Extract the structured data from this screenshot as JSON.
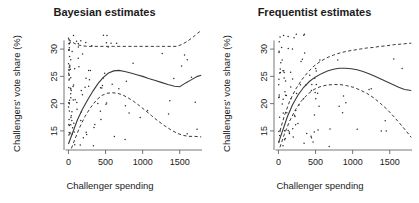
{
  "figure": {
    "running_head": "",
    "panels": [
      {
        "key": "bayesian",
        "title": "Bayesian estimates",
        "xlabel": "Challenger spending",
        "ylabel": "Challengers' vote share (%)"
      },
      {
        "key": "frequentist",
        "title": "Frequentist estimates",
        "xlabel": "Challenger spending",
        "ylabel": "Challengers' vote share (%)"
      }
    ],
    "xticks": [
      "0",
      "500",
      "1000",
      "1500"
    ],
    "yticks": [
      "15",
      "20",
      "25",
      "30"
    ]
  },
  "chart_data": [
    {
      "type": "line",
      "title": "Bayesian estimates",
      "xlabel": "Challenger spending",
      "ylabel": "Challengers' vote share (%)",
      "xlim": [
        -60,
        1800
      ],
      "ylim": [
        11.5,
        33.5
      ],
      "xticks": [
        0,
        500,
        1000,
        1500
      ],
      "yticks": [
        15,
        20,
        25,
        30
      ],
      "grid": false,
      "legend": "none",
      "series": [
        {
          "name": "posterior mean",
          "style": "solid",
          "x": [
            0,
            60,
            120,
            190,
            260,
            330,
            400,
            470,
            540,
            610,
            680,
            760,
            840,
            920,
            1000,
            1080,
            1160,
            1250,
            1340,
            1430,
            1500,
            1580,
            1660,
            1740,
            1790
          ],
          "y": [
            12.6,
            14.8,
            17.0,
            19.0,
            20.7,
            22.3,
            23.7,
            24.8,
            25.6,
            26.0,
            26.1,
            25.9,
            25.6,
            25.3,
            25.0,
            24.6,
            24.3,
            23.9,
            23.5,
            23.2,
            23.1,
            23.8,
            24.4,
            25.0,
            25.2
          ]
        },
        {
          "name": "upper 95% credible bound",
          "style": "dashed",
          "x": [
            0,
            60,
            120,
            190,
            260,
            330,
            400,
            470,
            540,
            610,
            700,
            800,
            900,
            1000,
            1100,
            1200,
            1300,
            1400,
            1460,
            1520,
            1600,
            1680,
            1740,
            1790
          ],
          "y": [
            31.8,
            31.2,
            30.8,
            30.6,
            30.5,
            30.5,
            30.5,
            30.5,
            30.5,
            30.5,
            30.5,
            30.5,
            30.5,
            30.5,
            30.5,
            30.5,
            30.5,
            30.5,
            30.5,
            30.8,
            31.4,
            32.2,
            32.9,
            33.4
          ]
        },
        {
          "name": "lower 95% credible bound",
          "style": "dashed",
          "x": [
            40,
            90,
            150,
            220,
            300,
            380,
            450,
            520,
            590,
            660,
            730,
            800,
            880,
            960,
            1040,
            1120,
            1200,
            1290,
            1380,
            1460,
            1540,
            1620,
            1700,
            1790
          ],
          "y": [
            11.8,
            13.6,
            15.6,
            17.6,
            19.3,
            20.7,
            21.5,
            21.9,
            22.0,
            21.9,
            21.6,
            21.1,
            20.4,
            19.6,
            18.7,
            17.8,
            16.9,
            16.0,
            15.2,
            14.6,
            14.2,
            14.0,
            14.0,
            13.9
          ]
        }
      ],
      "scatter": {
        "name": "observations",
        "n": 150,
        "note": "dense cluster at low challenger spending, spread across 12-33% vote share"
      }
    },
    {
      "type": "line",
      "title": "Frequentist estimates",
      "xlabel": "Challenger spending",
      "ylabel": "Challengers' vote share (%)",
      "xlim": [
        -60,
        1800
      ],
      "ylim": [
        11.5,
        33.5
      ],
      "xticks": [
        0,
        500,
        1000,
        1500
      ],
      "yticks": [
        15,
        20,
        25,
        30
      ],
      "grid": false,
      "legend": "none",
      "series": [
        {
          "name": "fitted smooth",
          "style": "solid",
          "x": [
            0,
            60,
            120,
            190,
            260,
            340,
            420,
            500,
            580,
            660,
            740,
            820,
            900,
            980,
            1060,
            1140,
            1220,
            1300,
            1380,
            1460,
            1540,
            1620,
            1700,
            1790
          ],
          "y": [
            12.8,
            15.2,
            17.6,
            19.8,
            21.5,
            23.0,
            24.1,
            24.9,
            25.5,
            26.0,
            26.3,
            26.5,
            26.5,
            26.4,
            26.2,
            25.9,
            25.5,
            25.0,
            24.5,
            24.0,
            23.5,
            23.0,
            22.6,
            22.4
          ]
        },
        {
          "name": "upper 95% confidence bound",
          "style": "dashed",
          "x": [
            20,
            80,
            150,
            230,
            310,
            400,
            480,
            560,
            650,
            740,
            830,
            920,
            1010,
            1100,
            1190,
            1280,
            1370,
            1460,
            1550,
            1640,
            1720,
            1790
          ],
          "y": [
            15.0,
            17.8,
            20.4,
            22.6,
            24.3,
            25.8,
            26.9,
            27.7,
            28.4,
            28.9,
            29.3,
            29.6,
            29.8,
            30.0,
            30.2,
            30.3,
            30.5,
            30.6,
            30.8,
            30.9,
            31.0,
            31.1
          ]
        },
        {
          "name": "lower 95% confidence bound",
          "style": "dashed",
          "x": [
            20,
            80,
            150,
            230,
            310,
            400,
            480,
            560,
            650,
            740,
            830,
            920,
            1010,
            1100,
            1190,
            1280,
            1370,
            1460,
            1550,
            1640,
            1720,
            1790
          ],
          "y": [
            12.0,
            14.4,
            16.8,
            18.9,
            20.5,
            21.8,
            22.6,
            23.1,
            23.4,
            23.5,
            23.5,
            23.3,
            23.0,
            22.5,
            21.9,
            21.1,
            20.1,
            19.0,
            17.7,
            16.3,
            15.0,
            13.8
          ]
        }
      ],
      "scatter": {
        "name": "observations",
        "n": 120,
        "note": "dense cluster at low challenger spending, spread across 12-33% vote share"
      }
    }
  ]
}
